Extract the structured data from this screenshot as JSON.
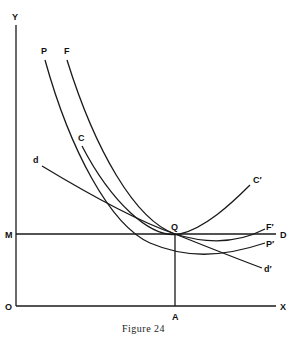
{
  "figure": {
    "caption": "Figure 24",
    "axes": {
      "y_label": "Y",
      "x_label": "X",
      "origin_label": "O"
    },
    "points": {
      "M": "M",
      "Q": "Q",
      "A": "A",
      "D": "D"
    },
    "curves": {
      "P": {
        "start": "P",
        "end": "P′"
      },
      "F": {
        "start": "F",
        "end": "F′"
      },
      "C": {
        "start": "C",
        "end": "C′"
      },
      "d": {
        "start": "d",
        "end": "d′"
      }
    }
  }
}
